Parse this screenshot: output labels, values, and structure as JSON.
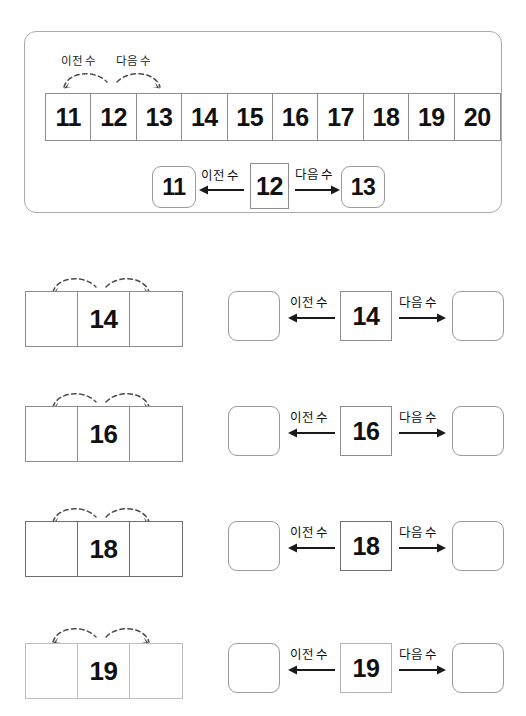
{
  "labels": {
    "previous": "이전 수",
    "next": "다음 수"
  },
  "example": {
    "strip": {
      "cells": [
        {
          "value": "11",
          "shaded": true
        },
        {
          "value": "12",
          "shaded": true
        },
        {
          "value": "13",
          "shaded": true
        },
        {
          "value": "14",
          "shaded": false
        },
        {
          "value": "15",
          "shaded": false
        },
        {
          "value": "16",
          "shaded": false
        },
        {
          "value": "17",
          "shaded": false
        },
        {
          "value": "18",
          "shaded": false
        },
        {
          "value": "19",
          "shaded": false
        },
        {
          "value": "20",
          "shaded": false
        }
      ]
    },
    "arc_previous_label": "이전 수",
    "arc_next_label": "다음 수",
    "flow": {
      "previous_value": "11",
      "center_value": "12",
      "next_value": "13",
      "previous_label": "이전 수",
      "next_label": "다음 수"
    }
  },
  "exercises": [
    {
      "number": "14",
      "strip_left": "",
      "strip_right": "",
      "answer_previous": "",
      "answer_next": "",
      "previous_label": "이전 수",
      "next_label": "다음 수"
    },
    {
      "number": "16",
      "strip_left": "",
      "strip_right": "",
      "answer_previous": "",
      "answer_next": "",
      "previous_label": "이전 수",
      "next_label": "다음 수"
    },
    {
      "number": "18",
      "strip_left": "",
      "strip_right": "",
      "answer_previous": "",
      "answer_next": "",
      "previous_label": "이전 수",
      "next_label": "다음 수"
    },
    {
      "number": "19",
      "strip_left": "",
      "strip_right": "",
      "answer_previous": "",
      "answer_next": "",
      "previous_label": "이전 수",
      "next_label": "다음 수"
    }
  ],
  "colors": {
    "shade_gray": "#d4d4d4",
    "border_gray": "#8d8d8d",
    "text_black": "#111111",
    "page_background": "#ffffff"
  }
}
